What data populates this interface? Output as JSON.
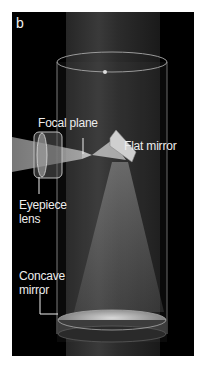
{
  "figure": {
    "panel_letter": "b",
    "labels": {
      "focal_plane": "Focal plane",
      "flat_mirror": "Flat mirror",
      "eyepiece_lens": [
        "Eyepiece",
        "lens"
      ],
      "concave_mirror": [
        "Concave",
        "mirror"
      ]
    }
  }
}
